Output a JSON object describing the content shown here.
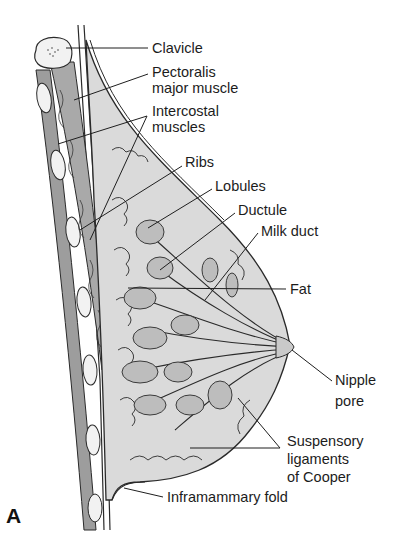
{
  "figure": {
    "panel_letter": "A",
    "colors": {
      "background": "#ffffff",
      "line": "#2a2a2a",
      "muscle_fill": "#a9a9a9",
      "tissue_fill": "#d9d9d9",
      "lobule_fill": "#bdbdbd",
      "bone_fill": "#f2f2f2"
    },
    "labels": {
      "clavicle": "Clavicle",
      "pectoralis_line1": "Pectoralis",
      "pectoralis_line2": "major muscle",
      "intercostal_line1": "Intercostal",
      "intercostal_line2": "muscles",
      "ribs": "Ribs",
      "lobules": "Lobules",
      "ductule": "Ductule",
      "milk_duct": "Milk duct",
      "fat": "Fat",
      "nipple_line1": "Nipple",
      "nipple_line2": "pore",
      "suspensory_line1": "Suspensory",
      "suspensory_line2": "ligaments",
      "suspensory_line3": "of Cooper",
      "inframammary_fold": "Inframammary fold"
    }
  }
}
